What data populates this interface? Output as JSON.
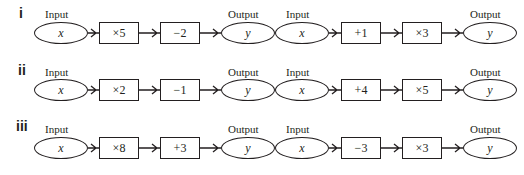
{
  "labels": {
    "input": "Input",
    "output": "Output"
  },
  "rows": [
    {
      "id": "i",
      "machines": [
        {
          "input": "x",
          "steps": [
            "×5",
            "−2"
          ],
          "output": "y"
        },
        {
          "input": "x",
          "steps": [
            "+1",
            "×3"
          ],
          "output": "y"
        }
      ]
    },
    {
      "id": "ii",
      "machines": [
        {
          "input": "x",
          "steps": [
            "×2",
            "−1"
          ],
          "output": "y"
        },
        {
          "input": "x",
          "steps": [
            "+4",
            "×5"
          ],
          "output": "y"
        }
      ]
    },
    {
      "id": "iii",
      "machines": [
        {
          "input": "x",
          "steps": [
            "×8",
            "+3"
          ],
          "output": "y"
        },
        {
          "input": "x",
          "steps": [
            "−3",
            "×3"
          ],
          "output": "y"
        }
      ]
    }
  ]
}
